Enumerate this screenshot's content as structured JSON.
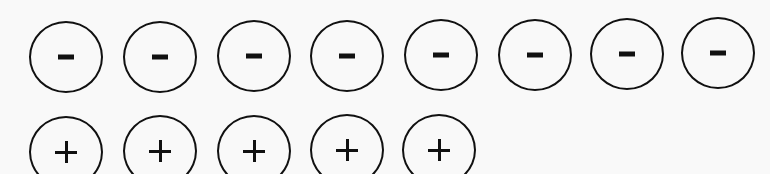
{
  "diagram": {
    "rows": [
      {
        "name": "negative-charges",
        "sign": "-",
        "count": 8,
        "items": [
          {
            "x": 29,
            "y": 21
          },
          {
            "x": 123,
            "y": 21
          },
          {
            "x": 217,
            "y": 20
          },
          {
            "x": 310,
            "y": 20
          },
          {
            "x": 404,
            "y": 19
          },
          {
            "x": 498,
            "y": 19
          },
          {
            "x": 590,
            "y": 18
          },
          {
            "x": 681,
            "y": 17
          }
        ]
      },
      {
        "name": "positive-charges",
        "sign": "+",
        "count": 5,
        "items": [
          {
            "x": 29,
            "y": 116
          },
          {
            "x": 123,
            "y": 115
          },
          {
            "x": 217,
            "y": 115
          },
          {
            "x": 310,
            "y": 114
          },
          {
            "x": 402,
            "y": 114
          }
        ]
      }
    ]
  }
}
